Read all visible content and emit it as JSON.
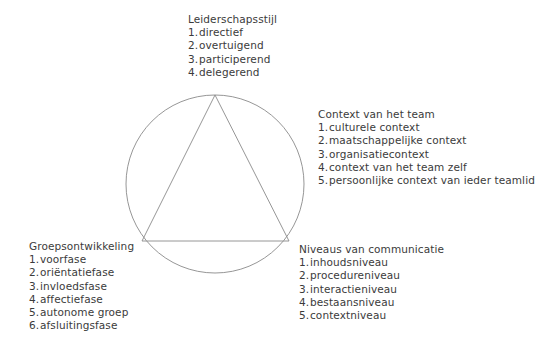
{
  "diagram": {
    "background_color": "#ffffff",
    "line_color": "#8a8a8a",
    "text_color": "#3b3b3b",
    "shapes": {
      "circle": {
        "name": "circle",
        "cx": 215,
        "cy": 184,
        "r": 89
      },
      "triangle": {
        "name": "inscribed-triangle",
        "apex": [
          215,
          95
        ],
        "left_vertex": [
          142,
          241
        ],
        "right_vertex": [
          289,
          241
        ]
      }
    }
  },
  "blocks": {
    "leiderschapsstijl": {
      "title": "Leiderschapsstijl",
      "items": [
        {
          "num": "1.",
          "text": "directief"
        },
        {
          "num": "2.",
          "text": "overtuigend"
        },
        {
          "num": "3.",
          "text": "participerend"
        },
        {
          "num": "4.",
          "text": "delegerend"
        }
      ]
    },
    "context": {
      "title": "Context van het team",
      "items": [
        {
          "num": "1.",
          "text": "culturele context"
        },
        {
          "num": "2.",
          "text": "maatschappelijke context"
        },
        {
          "num": "3.",
          "text": "organisatiecontext"
        },
        {
          "num": "4.",
          "text": "context van het team zelf"
        },
        {
          "num": "5.",
          "text": "persoonlijke context van ieder teamlid"
        }
      ]
    },
    "groepsontwikkeling": {
      "title": "Groepsontwikkeling",
      "items": [
        {
          "num": "1.",
          "text": "voorfase"
        },
        {
          "num": "2.",
          "text": "oriëntatiefase"
        },
        {
          "num": "3.",
          "text": "invloedsfase"
        },
        {
          "num": "4.",
          "text": "affectiefase"
        },
        {
          "num": "5.",
          "text": "autonome groep"
        },
        {
          "num": "6.",
          "text": "afsluitingsfase"
        }
      ]
    },
    "niveaus": {
      "title": "Niveaus van communicatie",
      "items": [
        {
          "num": "1.",
          "text": "inhoudsniveau"
        },
        {
          "num": "2.",
          "text": "procedureniveau"
        },
        {
          "num": "3.",
          "text": "interactieniveau"
        },
        {
          "num": "4.",
          "text": "bestaansniveau"
        },
        {
          "num": "5.",
          "text": "contextniveau"
        }
      ]
    }
  }
}
